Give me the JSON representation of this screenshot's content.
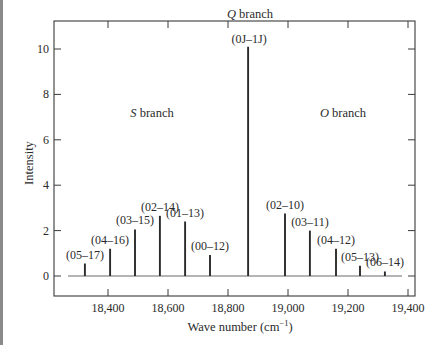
{
  "chart_data": {
    "type": "bar",
    "subtype": "stick-spectrum",
    "title": "",
    "xlabel": "Wave number (cm⁻¹)",
    "ylabel": "Intensity",
    "xlim": [
      18230,
      19430
    ],
    "ylim": [
      -0.9,
      11.2
    ],
    "grid": false,
    "legend": null,
    "x_ticks": [
      18400,
      18600,
      18800,
      19000,
      19200,
      19400
    ],
    "x_tick_labels": [
      "18,400",
      "18,600",
      "18,800",
      "19,000",
      "19,200",
      "19,400"
    ],
    "y_ticks": [
      0,
      2,
      4,
      6,
      8,
      10
    ],
    "y_tick_labels": [
      "0",
      "2",
      "4",
      "6",
      "8",
      "10"
    ],
    "annotations": [
      {
        "text_italic": "S",
        "text": " branch",
        "x": 18560,
        "y": 7.8
      },
      {
        "text_italic": "Q",
        "text": " branch",
        "x": 18867,
        "y": 11.0
      },
      {
        "text_italic": "O",
        "text": " branch",
        "x": 19120,
        "y": 7.8
      }
    ],
    "lines": [
      {
        "label": "(05–17)",
        "x": 18323,
        "intensity": 0.55
      },
      {
        "label": "(04–16)",
        "x": 18407,
        "intensity": 1.2
      },
      {
        "label": "(03–15)",
        "x": 18490,
        "intensity": 2.05
      },
      {
        "label": "(02–14)",
        "x": 18573,
        "intensity": 2.65
      },
      {
        "label": "(01–13)",
        "x": 18657,
        "intensity": 2.4
      },
      {
        "label": "(00–12)",
        "x": 18740,
        "intensity": 0.92
      },
      {
        "label": "(0J–1J)",
        "x": 18867,
        "intensity": 10.1
      },
      {
        "label": "(02–10)",
        "x": 18990,
        "intensity": 2.75
      },
      {
        "label": "(03–11)",
        "x": 19073,
        "intensity": 2.0
      },
      {
        "label": "(04–12)",
        "x": 19160,
        "intensity": 1.2
      },
      {
        "label": "(05–13)",
        "x": 19240,
        "intensity": 0.45
      },
      {
        "label": "(06–14)",
        "x": 19323,
        "intensity": 0.2
      }
    ],
    "categories": [
      "(05–17)",
      "(04–16)",
      "(03–15)",
      "(02–14)",
      "(01–13)",
      "(00–12)",
      "(0J–1J)",
      "(02–10)",
      "(03–11)",
      "(04–12)",
      "(05–13)",
      "(06–14)"
    ],
    "values": [
      0.55,
      1.2,
      2.05,
      2.65,
      2.4,
      0.92,
      10.1,
      2.75,
      2.0,
      1.2,
      0.45,
      0.2
    ]
  },
  "labels": {
    "xlabel_main": "Wave number (cm",
    "xlabel_sup": "−1",
    "xlabel_close": ")",
    "ylabel": "Intensity",
    "s_branch_italic": "S",
    "o_branch_italic": "O",
    "q_branch_italic": "Q",
    "branch_word": " branch"
  },
  "colors": {
    "ink": "#2a2a2a",
    "frame": "#3a3a3a",
    "edge_bar": "#8a8a8a",
    "background": "#ffffff"
  }
}
